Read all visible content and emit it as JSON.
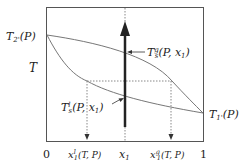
{
  "diagram": {
    "type": "binary-phase-diagram-Txy",
    "y_axis_label": "T",
    "left_endpoint_label": {
      "base": "T",
      "sub": "2'",
      "arg": "(P)"
    },
    "right_endpoint_label": {
      "base": "T",
      "sub": "1'",
      "arg": "(P)"
    },
    "x_ticks": {
      "zero": "0",
      "one": "1",
      "x_liquid": {
        "base": "x",
        "sub": "1",
        "sup": "l",
        "arg": "(T, P)"
      },
      "x_mid": {
        "base": "x",
        "sub": "1"
      },
      "x_gas": {
        "base": "x",
        "sub": "1",
        "sup": "g",
        "arg": "(T, P)"
      }
    },
    "curve_labels": {
      "vapor": {
        "base": "T",
        "sub": "s",
        "sup": "g",
        "arg": "(P, x",
        "arg_sub": "1",
        "arg_end": ")"
      },
      "liquid": {
        "base": "T",
        "sub": "s",
        "sup": "l",
        "arg": "(P, x",
        "arg_sub": "1",
        "arg_end": ")"
      }
    },
    "colors": {
      "frame": "#555555",
      "curve": "#777777",
      "arrow": "#222222",
      "dotted": "#888888"
    }
  }
}
